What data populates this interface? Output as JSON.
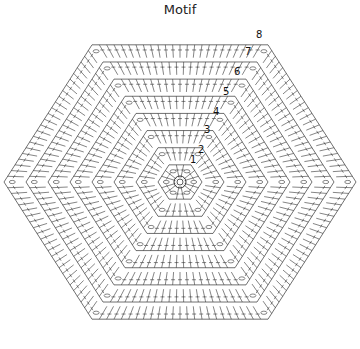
{
  "title": "Motif",
  "chart": {
    "shape": "hexagon",
    "center": [
      180,
      182
    ],
    "outer_radius": 176,
    "rounds": 8,
    "round_labels": [
      "1",
      "2",
      "3",
      "4",
      "5",
      "6",
      "7",
      "8"
    ],
    "label_positions": [
      [
        190,
        163
      ],
      [
        198,
        153
      ],
      [
        204,
        133
      ],
      [
        213,
        115
      ],
      [
        223,
        95
      ],
      [
        234,
        75
      ],
      [
        245,
        55
      ],
      [
        256,
        38
      ]
    ],
    "stroke_color": "#333333",
    "background": "#ffffff"
  }
}
